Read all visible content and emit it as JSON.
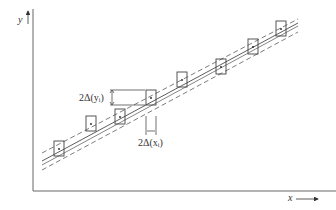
{
  "diagram": {
    "axes": {
      "x_label": "x",
      "y_label": "y"
    },
    "annotations": {
      "y_error": "2Δ(yᵢ)",
      "x_error": "2Δ(xᵢ)"
    },
    "colors": {
      "line": "#333333",
      "axis": "#555555",
      "box": "#444444"
    },
    "points": [
      {
        "cx": 59,
        "cy": 149
      },
      {
        "cx": 91,
        "cy": 124
      },
      {
        "cx": 120,
        "cy": 117
      },
      {
        "cx": 151,
        "cy": 98
      },
      {
        "cx": 182,
        "cy": 80
      },
      {
        "cx": 221,
        "cy": 67
      },
      {
        "cx": 253,
        "cy": 47
      },
      {
        "cx": 281,
        "cy": 29
      }
    ],
    "box_size": {
      "w": 10,
      "h": 15
    },
    "fit_lines": {
      "solid": {
        "x1": 42,
        "y1": 160,
        "x2": 298,
        "y2": 22
      },
      "dashed_upper": {
        "x1": 42,
        "y1": 152,
        "x2": 298,
        "y2": 18
      },
      "dashed_lower": {
        "x1": 42,
        "y1": 168,
        "x2": 298,
        "y2": 28
      }
    }
  }
}
